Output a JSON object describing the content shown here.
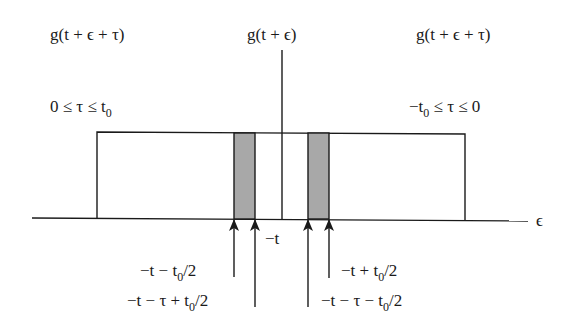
{
  "labels": {
    "left_function": "g(t + ϵ + τ)",
    "center_function": "g(t + ϵ)",
    "right_function": "g(t + ϵ + τ)",
    "left_range": "0 ≤ τ ≤ t",
    "left_range_sub": "0",
    "right_range_pre": "−t",
    "right_range_sub": "0",
    "right_range_post": " ≤ τ ≤ 0",
    "axis_label": "ϵ",
    "minus_t": "−t",
    "arrow1_a": "−t − t",
    "arrow1_sub": "0",
    "arrow1_b": "/2",
    "arrow2_a": "−t − τ + t",
    "arrow2_sub": "0",
    "arrow2_b": "/2",
    "arrow3_a": "−t − τ − t",
    "arrow3_sub": "0",
    "arrow3_b": "/2",
    "arrow4_a": "−t + t",
    "arrow4_sub": "0",
    "arrow4_b": "/2"
  },
  "colors": {
    "shade": "#a8a8a8",
    "line": "#1a1a1a"
  }
}
